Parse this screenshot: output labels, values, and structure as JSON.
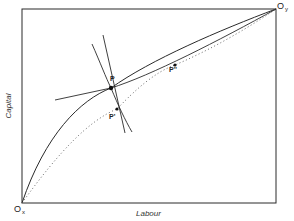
{
  "diagram": {
    "type": "edgeworth-box",
    "axes": {
      "x_label": "Labour",
      "y_label": "Capital"
    },
    "origins": {
      "x": {
        "letter": "O",
        "subscript": "x"
      },
      "y": {
        "letter": "O",
        "subscript": "y"
      }
    },
    "points": {
      "p": "P",
      "p_prime": "P'",
      "p_double_prime": "P''"
    },
    "colors": {
      "line": "#2a2a2a",
      "dotted": "#555555",
      "background": "#ffffff"
    }
  }
}
